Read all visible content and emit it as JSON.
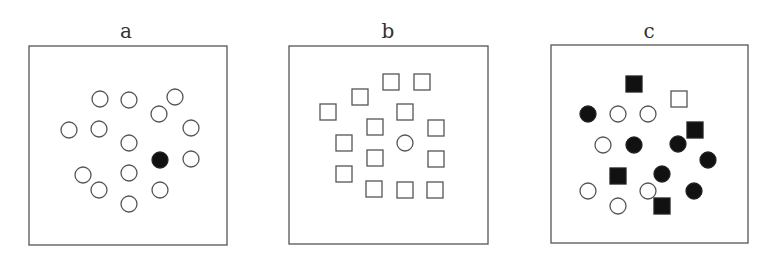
{
  "figure": {
    "panels": [
      {
        "label": "a",
        "label_pos": [
          126,
          38
        ],
        "frame": [
          29,
          46,
          198,
          199
        ],
        "items": [
          {
            "shape": "circle",
            "fill": "open",
            "x": 100,
            "y": 99
          },
          {
            "shape": "circle",
            "fill": "open",
            "x": 129,
            "y": 100
          },
          {
            "shape": "circle",
            "fill": "open",
            "x": 175,
            "y": 97
          },
          {
            "shape": "circle",
            "fill": "open",
            "x": 159,
            "y": 114
          },
          {
            "shape": "circle",
            "fill": "open",
            "x": 69,
            "y": 130
          },
          {
            "shape": "circle",
            "fill": "open",
            "x": 99,
            "y": 129
          },
          {
            "shape": "circle",
            "fill": "open",
            "x": 191,
            "y": 128
          },
          {
            "shape": "circle",
            "fill": "open",
            "x": 129,
            "y": 143
          },
          {
            "shape": "circle",
            "fill": "filled",
            "x": 160,
            "y": 160
          },
          {
            "shape": "circle",
            "fill": "open",
            "x": 191,
            "y": 159
          },
          {
            "shape": "circle",
            "fill": "open",
            "x": 83,
            "y": 175
          },
          {
            "shape": "circle",
            "fill": "open",
            "x": 129,
            "y": 173
          },
          {
            "shape": "circle",
            "fill": "open",
            "x": 99,
            "y": 190
          },
          {
            "shape": "circle",
            "fill": "open",
            "x": 160,
            "y": 190
          },
          {
            "shape": "circle",
            "fill": "open",
            "x": 129,
            "y": 204
          }
        ]
      },
      {
        "label": "b",
        "label_pos": [
          388,
          38
        ],
        "frame": [
          289,
          46,
          199,
          198
        ],
        "items": [
          {
            "shape": "square",
            "fill": "open",
            "x": 391,
            "y": 82
          },
          {
            "shape": "square",
            "fill": "open",
            "x": 422,
            "y": 82
          },
          {
            "shape": "square",
            "fill": "open",
            "x": 360,
            "y": 97
          },
          {
            "shape": "square",
            "fill": "open",
            "x": 328,
            "y": 112
          },
          {
            "shape": "square",
            "fill": "open",
            "x": 405,
            "y": 112
          },
          {
            "shape": "square",
            "fill": "open",
            "x": 375,
            "y": 127
          },
          {
            "shape": "square",
            "fill": "open",
            "x": 436,
            "y": 128
          },
          {
            "shape": "square",
            "fill": "open",
            "x": 344,
            "y": 143
          },
          {
            "shape": "circle",
            "fill": "open",
            "x": 405,
            "y": 143
          },
          {
            "shape": "square",
            "fill": "open",
            "x": 375,
            "y": 158
          },
          {
            "shape": "square",
            "fill": "open",
            "x": 436,
            "y": 159
          },
          {
            "shape": "square",
            "fill": "open",
            "x": 344,
            "y": 174
          },
          {
            "shape": "square",
            "fill": "open",
            "x": 374,
            "y": 189
          },
          {
            "shape": "square",
            "fill": "open",
            "x": 405,
            "y": 190
          },
          {
            "shape": "square",
            "fill": "open",
            "x": 435,
            "y": 190
          }
        ]
      },
      {
        "label": "c",
        "label_pos": [
          649,
          38
        ],
        "frame": [
          551,
          45,
          197,
          198
        ],
        "items": [
          {
            "shape": "square",
            "fill": "filled",
            "x": 634,
            "y": 84
          },
          {
            "shape": "square",
            "fill": "open",
            "x": 679,
            "y": 99
          },
          {
            "shape": "circle",
            "fill": "filled",
            "x": 588,
            "y": 114
          },
          {
            "shape": "circle",
            "fill": "open",
            "x": 618,
            "y": 114
          },
          {
            "shape": "circle",
            "fill": "open",
            "x": 648,
            "y": 114
          },
          {
            "shape": "square",
            "fill": "filled",
            "x": 695,
            "y": 130
          },
          {
            "shape": "circle",
            "fill": "open",
            "x": 603,
            "y": 145
          },
          {
            "shape": "circle",
            "fill": "filled",
            "x": 634,
            "y": 145
          },
          {
            "shape": "circle",
            "fill": "filled",
            "x": 678,
            "y": 144
          },
          {
            "shape": "circle",
            "fill": "filled",
            "x": 708,
            "y": 160
          },
          {
            "shape": "square",
            "fill": "filled",
            "x": 618,
            "y": 176
          },
          {
            "shape": "circle",
            "fill": "filled",
            "x": 662,
            "y": 174
          },
          {
            "shape": "circle",
            "fill": "open",
            "x": 588,
            "y": 191
          },
          {
            "shape": "circle",
            "fill": "open",
            "x": 648,
            "y": 191
          },
          {
            "shape": "circle",
            "fill": "filled",
            "x": 694,
            "y": 191
          },
          {
            "shape": "circle",
            "fill": "open",
            "x": 618,
            "y": 206
          },
          {
            "shape": "square",
            "fill": "filled",
            "x": 662,
            "y": 206
          }
        ]
      }
    ],
    "circle_radius": 8,
    "square_size": 16,
    "colors": {
      "stroke": "#555555",
      "filled": "#111111",
      "background": "#ffffff"
    }
  }
}
